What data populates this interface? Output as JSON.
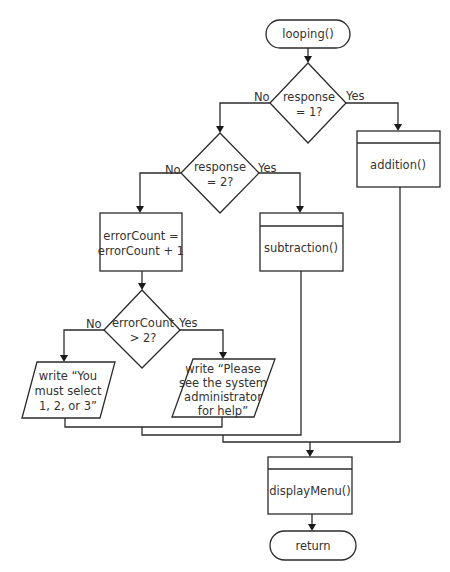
{
  "diagram": {
    "type": "flowchart",
    "nodes": {
      "start": {
        "kind": "terminator",
        "lines": [
          "looping()"
        ]
      },
      "decision1": {
        "kind": "decision",
        "lines": [
          "response",
          "= 1?"
        ],
        "yes_label": "Yes",
        "no_label": "No"
      },
      "addition": {
        "kind": "predefined-process",
        "lines": [
          "addition()"
        ]
      },
      "decision2": {
        "kind": "decision",
        "lines": [
          "response",
          "= 2?"
        ],
        "yes_label": "Yes",
        "no_label": "No"
      },
      "subtraction": {
        "kind": "predefined-process",
        "lines": [
          "subtraction()"
        ]
      },
      "increment": {
        "kind": "process",
        "lines": [
          "errorCount =",
          "errorCount + 1"
        ]
      },
      "decision3": {
        "kind": "decision",
        "lines": [
          "errorCount",
          "> 2?"
        ],
        "yes_label": "Yes",
        "no_label": "No"
      },
      "output_select": {
        "kind": "io",
        "lines": [
          "write “You",
          "must select",
          "1, 2, or 3”"
        ]
      },
      "output_admin": {
        "kind": "io",
        "lines": [
          "write “Please",
          "see the system",
          "administrator",
          "for help”"
        ]
      },
      "display_menu": {
        "kind": "predefined-process",
        "lines": [
          "displayMenu()"
        ]
      },
      "end": {
        "kind": "terminator",
        "lines": [
          "return"
        ]
      }
    },
    "edges": [
      {
        "from": "start",
        "to": "decision1"
      },
      {
        "from": "decision1",
        "to": "addition",
        "label": "Yes"
      },
      {
        "from": "decision1",
        "to": "decision2",
        "label": "No"
      },
      {
        "from": "decision2",
        "to": "subtraction",
        "label": "Yes"
      },
      {
        "from": "decision2",
        "to": "increment",
        "label": "No"
      },
      {
        "from": "increment",
        "to": "decision3"
      },
      {
        "from": "decision3",
        "to": "output_admin",
        "label": "Yes"
      },
      {
        "from": "decision3",
        "to": "output_select",
        "label": "No"
      },
      {
        "from": "output_select",
        "to": "display_menu"
      },
      {
        "from": "output_admin",
        "to": "display_menu"
      },
      {
        "from": "subtraction",
        "to": "display_menu"
      },
      {
        "from": "addition",
        "to": "display_menu"
      },
      {
        "from": "display_menu",
        "to": "end"
      }
    ]
  }
}
